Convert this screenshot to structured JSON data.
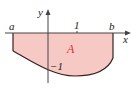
{
  "diagram": {
    "labels": {
      "x_axis": "x",
      "y_axis": "y",
      "left_bound": "a",
      "right_bound": "b",
      "x_tick": "1",
      "y_tick": "−1",
      "region": "A"
    },
    "colors": {
      "region_fill": "#f6c9c4",
      "region_label": "#d9343a",
      "curve": "#3a1f1f",
      "axes": "#444444"
    }
  }
}
